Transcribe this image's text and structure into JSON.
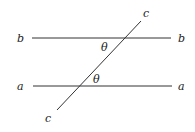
{
  "diagram": {
    "colors": {
      "line": "#333333",
      "text": "#222222",
      "background": "#ffffff"
    },
    "lines": [
      {
        "id": "b",
        "x1": 32,
        "y1": 38,
        "x2": 171,
        "y2": 38
      },
      {
        "id": "a",
        "x1": 33,
        "y1": 86,
        "x2": 172,
        "y2": 86
      },
      {
        "id": "c",
        "x1": 57,
        "y1": 110,
        "x2": 141,
        "y2": 21
      }
    ],
    "labels": {
      "b_left": "b",
      "b_right": "b",
      "a_left": "a",
      "a_right": "a",
      "c_top": "c",
      "c_bottom": "c",
      "theta_upper": "θ",
      "theta_lower": "θ"
    }
  }
}
